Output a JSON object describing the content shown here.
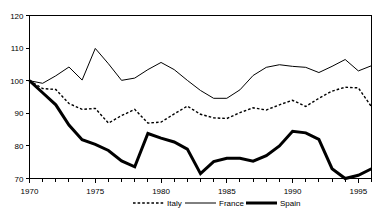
{
  "chart_data": {
    "type": "line",
    "title": "",
    "xlabel": "",
    "ylabel": "",
    "xlim": [
      1970,
      1996
    ],
    "ylim": [
      70,
      120
    ],
    "grid": false,
    "legend_position": "bottom",
    "y_ticks": [
      70,
      80,
      90,
      100,
      110,
      120
    ],
    "y_tick_labels": [
      "70",
      "80",
      "90",
      "100",
      "110",
      "120"
    ],
    "x_ticks": [
      1970,
      1975,
      1980,
      1985,
      1990,
      1995
    ],
    "x_tick_labels": [
      "1970",
      "1975",
      "1980",
      "1985",
      "1990",
      "1995"
    ],
    "x": [
      1970,
      1971,
      1972,
      1973,
      1974,
      1975,
      1976,
      1977,
      1978,
      1979,
      1980,
      1981,
      1982,
      1983,
      1984,
      1985,
      1986,
      1987,
      1988,
      1989,
      1990,
      1991,
      1992,
      1993,
      1994,
      1995,
      1996
    ],
    "series": [
      {
        "name": "Italy",
        "style": "dashed",
        "values": [
          100.0,
          97.6,
          97.3,
          93.0,
          91.2,
          91.5,
          87.0,
          89.3,
          91.2,
          87.0,
          87.3,
          89.8,
          92.2,
          89.7,
          88.6,
          88.4,
          90.2,
          91.7,
          91.0,
          92.6,
          94.0,
          92.1,
          94.6,
          96.8,
          98.0,
          97.8,
          92.0
        ]
      },
      {
        "name": "France",
        "style": "solid-thin",
        "values": [
          100.0,
          99.2,
          101.5,
          104.2,
          100.2,
          109.9,
          105.2,
          100.1,
          100.8,
          103.4,
          105.6,
          103.4,
          100.1,
          97.0,
          94.6,
          94.6,
          97.2,
          101.6,
          104.1,
          104.9,
          104.4,
          104.1,
          102.5,
          104.4,
          106.5,
          103.0,
          104.6
        ]
      },
      {
        "name": "Spain",
        "style": "solid-thick",
        "values": [
          100.0,
          96.3,
          92.6,
          86.4,
          81.9,
          80.5,
          78.6,
          75.4,
          73.6,
          83.8,
          82.4,
          81.2,
          79.0,
          71.5,
          75.2,
          76.2,
          76.2,
          75.3,
          77.0,
          80.0,
          84.5,
          84.0,
          82.0,
          73.0,
          70.0,
          71.0,
          73.0
        ]
      }
    ]
  },
  "legend": {
    "items": [
      {
        "label": "Italy",
        "style": "dashed"
      },
      {
        "label": "France",
        "style": "solid-thin"
      },
      {
        "label": "Spain",
        "style": "solid-thick"
      }
    ]
  }
}
